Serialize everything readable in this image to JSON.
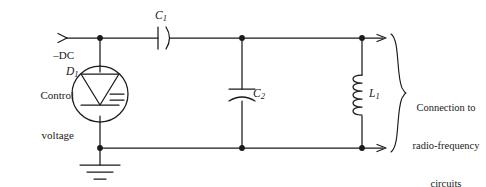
{
  "figure": {
    "kind": "schematic-diagram",
    "ink_color": "#1a1a1a",
    "background_color": "#ffffff"
  },
  "source": {
    "line1": "–DC",
    "line2": "Control",
    "line3": "voltage",
    "arrow_glyph": "input-arrow"
  },
  "components": {
    "d1": {
      "ref": "D",
      "sub": "1",
      "type": "varactor-diode",
      "symbol": "circled triangle with cathode bar and capacitor plates"
    },
    "c1": {
      "ref": "C",
      "sub": "1",
      "type": "capacitor",
      "symbol": "one straight plate and one curved plate, horizontal"
    },
    "c2": {
      "ref": "C",
      "sub": "2",
      "type": "capacitor",
      "symbol": "one straight plate and one curved plate, vertical"
    },
    "l1": {
      "ref": "L",
      "sub": "1",
      "type": "inductor",
      "symbol": "five-loop coil, vertical"
    },
    "ground": {
      "type": "earth-ground",
      "symbol": "three stacked horizontal bars"
    }
  },
  "annotation": {
    "brace": "right-curly-brace",
    "line1": "Connection to",
    "line2": "radio-frequency",
    "line3": "circuits"
  },
  "nodes": {
    "top_rail_y": 38,
    "bottom_rail_y": 148,
    "node_x_left": 100,
    "node_x_middle": 242,
    "node_x_right": 362,
    "junction_dots": 6
  }
}
